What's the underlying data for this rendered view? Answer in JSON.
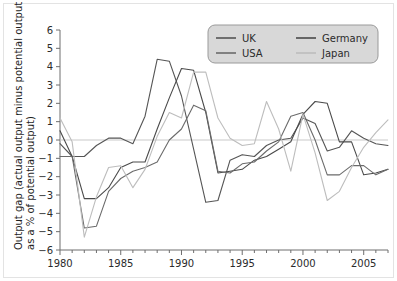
{
  "chart_data": {
    "type": "line",
    "title": "",
    "xlabel": "",
    "ylabel": "Output gap (actual output minus potential output as a % of potential output)",
    "xlim": [
      1980,
      2007
    ],
    "ylim": [
      -6,
      6
    ],
    "grid": false,
    "zero_line": true,
    "legend_position": "top-right",
    "x": [
      1980,
      1981,
      1982,
      1983,
      1984,
      1985,
      1986,
      1987,
      1988,
      1989,
      1990,
      1991,
      1992,
      1993,
      1994,
      1995,
      1996,
      1997,
      1998,
      1999,
      2000,
      2001,
      2002,
      2003,
      2004,
      2005,
      2006,
      2007
    ],
    "x_ticks": [
      1980,
      1985,
      1990,
      1995,
      2000,
      2005
    ],
    "x_tick_labels": [
      "1980",
      "1985",
      "1990",
      "1995",
      "2000",
      "2005"
    ],
    "y_ticks": [
      -6,
      -5,
      -4,
      -3,
      -2,
      -1,
      0,
      1,
      2,
      3,
      4,
      5,
      6
    ],
    "y_tick_labels": [
      "−6",
      "−5",
      "−4",
      "−3",
      "−2",
      "−1",
      "0",
      "1",
      "2",
      "3",
      "4",
      "5",
      "6"
    ],
    "series": [
      {
        "name": "UK",
        "color": "#555555",
        "values": [
          -0.2,
          -0.9,
          -0.9,
          -0.3,
          0.1,
          0.1,
          -0.2,
          1.3,
          4.4,
          4.3,
          2.4,
          -0.5,
          -3.4,
          -3.3,
          -1.1,
          -0.8,
          -0.9,
          -0.3,
          0.0,
          0.1,
          1.2,
          0.9,
          -0.6,
          -0.4,
          0.5,
          0.1,
          -0.2,
          -0.3
        ]
      },
      {
        "name": "Germany",
        "color": "#4a4a4a",
        "values": [
          0.5,
          -0.9,
          -3.2,
          -3.2,
          -2.6,
          -1.5,
          -1.2,
          -1.2,
          0.6,
          2.3,
          3.9,
          3.8,
          1.5,
          -1.8,
          -1.7,
          -1.6,
          -1.1,
          -0.9,
          -0.5,
          -0.1,
          1.4,
          2.1,
          2.0,
          -0.1,
          -0.1,
          -1.9,
          -1.8,
          -1.6
        ]
      },
      {
        "name": "USA",
        "color": "#6b6b6b",
        "values": [
          -0.9,
          -0.9,
          -4.8,
          -4.7,
          -2.8,
          -2.1,
          -1.7,
          -1.5,
          -1.2,
          0.0,
          0.6,
          1.9,
          1.6,
          -1.7,
          -1.8,
          -1.3,
          -1.2,
          -0.6,
          -0.1,
          1.3,
          1.5,
          0.0,
          -1.9,
          -1.9,
          -1.4,
          -1.4,
          -1.9,
          -1.6
        ]
      },
      {
        "name": "Japan",
        "color": "#bdbdbd",
        "values": [
          1.2,
          -0.1,
          -5.3,
          -3.1,
          -1.5,
          -1.4,
          -2.6,
          -1.6,
          0.2,
          1.5,
          1.2,
          3.7,
          3.7,
          1.2,
          0.1,
          -0.3,
          -0.2,
          2.1,
          0.6,
          -1.7,
          1.4,
          -0.7,
          -3.3,
          -2.8,
          -1.5,
          -0.4,
          0.4,
          1.1
        ]
      }
    ],
    "legend_entries": [
      {
        "label": "UK",
        "color": "#555555"
      },
      {
        "label": "Germany",
        "color": "#4a4a4a"
      },
      {
        "label": "USA",
        "color": "#6b6b6b"
      },
      {
        "label": "Japan",
        "color": "#bdbdbd"
      }
    ]
  },
  "colors": {
    "background": "#ffffff",
    "axis": "#6e6e6e",
    "zero_line": "#c9c9c9",
    "legend_background": "#d8d8d8",
    "legend_border": "#9a9a9a",
    "text": "#2b2b2b"
  }
}
